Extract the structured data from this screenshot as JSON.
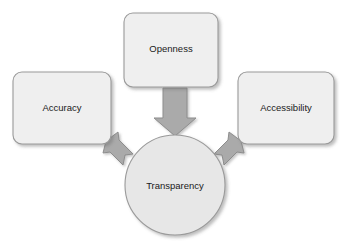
{
  "diagram": {
    "type": "convergence-concept-diagram",
    "background_color": "#ffffff",
    "hub": {
      "label": "Transparency",
      "shape": "circle",
      "center_x": 175,
      "center_y": 185,
      "radius": 50,
      "fill_color": "#e7e7e7",
      "stroke_color": "#9a9a9a"
    },
    "nodes": [
      {
        "id": "openness",
        "label": "Openness",
        "shape": "rounded-rectangle",
        "x": 124,
        "y": 13,
        "width": 94,
        "height": 74,
        "fill_color": "#efefef",
        "stroke_color": "#9a9a9a"
      },
      {
        "id": "accuracy",
        "label": "Accuracy",
        "shape": "rounded-rectangle",
        "x": 13,
        "y": 72,
        "width": 98,
        "height": 72,
        "fill_color": "#efefef",
        "stroke_color": "#9a9a9a"
      },
      {
        "id": "accessibility",
        "label": "Accessibility",
        "shape": "rounded-rectangle",
        "x": 238,
        "y": 72,
        "width": 96,
        "height": 72,
        "fill_color": "#efefef",
        "stroke_color": "#9a9a9a"
      }
    ],
    "arrows": [
      {
        "id": "openness-to-transparency",
        "from": "openness",
        "to": "transparency",
        "direction": "down",
        "fill_color": "#aaaaaa",
        "stroke_color": "#8d8d8d"
      },
      {
        "id": "accuracy-to-transparency",
        "from": "accuracy",
        "to": "transparency",
        "direction": "down-right",
        "fill_color": "#aaaaaa",
        "stroke_color": "#8d8d8d"
      },
      {
        "id": "accessibility-to-transparency",
        "from": "accessibility",
        "to": "transparency",
        "direction": "down-left",
        "fill_color": "#aaaaaa",
        "stroke_color": "#8d8d8d"
      }
    ]
  }
}
